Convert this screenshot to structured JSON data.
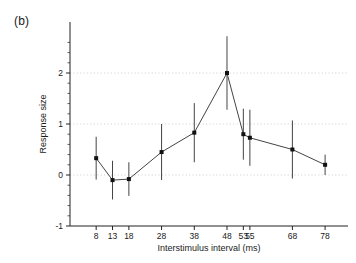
{
  "figure": {
    "panel_label": "(b)"
  },
  "chart_data": {
    "type": "line",
    "title": "",
    "subtitle": "",
    "xlabel": "Interstimulus interval (ms)",
    "ylabel": "Response size",
    "xlim": [
      0,
      85
    ],
    "ylim": [
      -1,
      2.7
    ],
    "grid": "dotted-horizontal-light",
    "legend": "none",
    "x_tick_labels": [
      "8",
      "13",
      "18",
      "28",
      "38",
      "48",
      "53",
      "55",
      "68",
      "78"
    ],
    "x_tick_values": [
      8,
      13,
      18,
      28,
      38,
      48,
      53,
      55,
      68,
      78
    ],
    "y_tick_labels": [
      "-1",
      "0",
      "1",
      "2"
    ],
    "y_tick_values": [
      -1,
      0,
      1,
      2
    ],
    "y_minor_tick_step": 0.2,
    "marker": "filled-square",
    "error_bars": "vertical",
    "series": [
      {
        "name": "Response size",
        "x": [
          8,
          13,
          18,
          28,
          38,
          48,
          53,
          55,
          68,
          78
        ],
        "values": [
          0.33,
          -0.1,
          -0.08,
          0.45,
          0.83,
          2.0,
          0.8,
          0.73,
          0.5,
          0.2
        ],
        "errors": [
          0.42,
          0.38,
          0.33,
          0.55,
          0.58,
          0.72,
          0.5,
          0.55,
          0.57,
          0.2
        ]
      }
    ]
  }
}
